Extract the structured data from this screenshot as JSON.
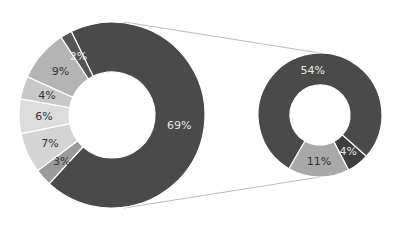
{
  "chart_data": {
    "type": "pie",
    "subtype": "donut-of-donut (bar-of-pie style)",
    "title": "",
    "primary": {
      "categories": [
        "A",
        "B",
        "C",
        "D",
        "E",
        "F",
        "G"
      ],
      "values": [
        69,
        3,
        7,
        6,
        4,
        9,
        2
      ],
      "labels": [
        "69%",
        "3%",
        "7%",
        "6%",
        "4%",
        "9%",
        "2%"
      ],
      "colors": [
        "#4a4a4a",
        "#9a9a9a",
        "#d4d4d4",
        "#dcdcdc",
        "#c8c8c8",
        "#b4b4b4",
        "#555555"
      ]
    },
    "secondary": {
      "categories": [
        "A1",
        "A2",
        "A3"
      ],
      "values": [
        54,
        4,
        11
      ],
      "labels": [
        "54%",
        "4%",
        "11%"
      ],
      "colors": [
        "#4a4a4a",
        "#3e3e3e",
        "#a8a8a8"
      ]
    },
    "legend": "none",
    "connector_lines": true
  }
}
